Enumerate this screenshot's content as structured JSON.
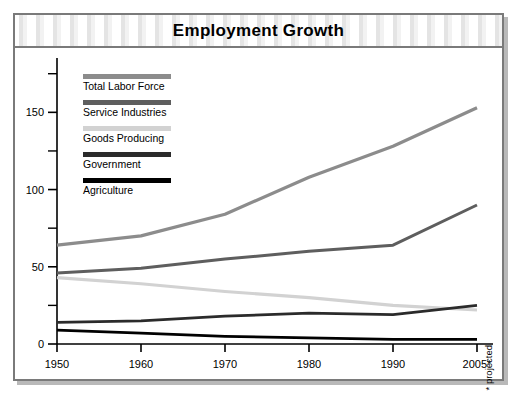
{
  "card": {
    "title": "Employment Growth"
  },
  "chart_data": {
    "type": "line",
    "title": "Employment Growth",
    "xlabel": "",
    "ylabel": "",
    "grid": false,
    "legend_position": "inside-top-left",
    "categories": [
      "1950",
      "1960",
      "1970",
      "1980",
      "1990",
      "2005*"
    ],
    "xlim": [
      1950,
      2005
    ],
    "ylim": [
      0,
      180
    ],
    "yticks_major": [
      0,
      50,
      100,
      150
    ],
    "yticks_minor": [
      25,
      75,
      125,
      175
    ],
    "xticks": [
      "1950",
      "1960",
      "1970",
      "1980",
      "1990",
      "2005*"
    ],
    "annotation": "* projected",
    "series": [
      {
        "name": "Total Labor Force",
        "color": "#8c8c8c",
        "values": [
          64,
          70,
          84,
          108,
          128,
          153
        ]
      },
      {
        "name": "Service Industries",
        "color": "#5e5e5e",
        "values": [
          46,
          49,
          55,
          60,
          64,
          90
        ]
      },
      {
        "name": "Goods Producing",
        "color": "#d2d2d2",
        "values": [
          43,
          39,
          34,
          30,
          25,
          22
        ]
      },
      {
        "name": "Government",
        "color": "#2b2b2b",
        "values": [
          14,
          15,
          18,
          20,
          19,
          25
        ]
      },
      {
        "name": "Agriculture",
        "color": "#000000",
        "values": [
          9,
          7,
          5,
          4,
          3,
          3
        ]
      }
    ]
  },
  "legend": {
    "items": [
      {
        "label": "Total Labor Force",
        "swatch": "#8c8c8c"
      },
      {
        "label": "Service Industries",
        "swatch": "#5e5e5e"
      },
      {
        "label": "Goods Producing",
        "swatch": "#d2d2d2"
      },
      {
        "label": "Government",
        "swatch": "#2b2b2b"
      },
      {
        "label": "Agriculture",
        "swatch": "#000000"
      }
    ]
  },
  "notes": {
    "projected": "* projected"
  },
  "colors": {
    "frame": "#7a7a7a",
    "shadow": "#b9b9b9",
    "axis": "#000000",
    "background": "#ffffff"
  }
}
